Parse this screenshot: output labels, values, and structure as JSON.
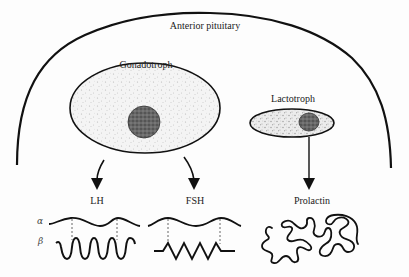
{
  "title": "Anterior pituitary",
  "cells": [
    {
      "name": "Gonadotroph",
      "hormones": [
        "LH",
        "FSH"
      ]
    },
    {
      "name": "Lactotroph",
      "hormones": [
        "Prolactin"
      ]
    }
  ],
  "hormones": {
    "lh": "LH",
    "fsh": "FSH",
    "prolactin": "Prolactin"
  },
  "subunits": {
    "alpha": "α",
    "beta": "β"
  },
  "colors": {
    "ink": "#111111",
    "background": "#fdfdfd",
    "cytoplasm_stipple": "#b0b0b0",
    "nucleus": "#555555"
  }
}
